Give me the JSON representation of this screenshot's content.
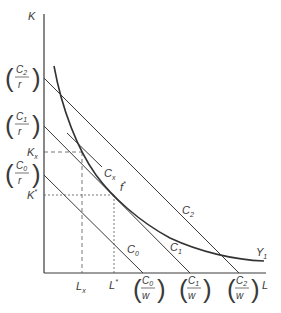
{
  "diagram": {
    "type": "isoquant-isocost",
    "axes": {
      "y_label": "K",
      "x_label": "L"
    },
    "y_intercepts": [
      {
        "num": "C",
        "num_sub": "2",
        "den": "r"
      },
      {
        "num": "C",
        "num_sub": "1",
        "den": "r"
      },
      {
        "num": "C",
        "num_sub": "0",
        "den": "r"
      }
    ],
    "x_intercepts": [
      {
        "num": "C",
        "num_sub": "0",
        "den": "w"
      },
      {
        "num": "C",
        "num_sub": "1",
        "den": "w"
      },
      {
        "num": "C",
        "num_sub": "2",
        "den": "w"
      }
    ],
    "y_ticks": [
      {
        "base": "K",
        "sub": "x"
      },
      {
        "base": "K",
        "sup": "*"
      }
    ],
    "x_ticks": [
      {
        "base": "L",
        "sub": "x"
      },
      {
        "base": "L",
        "sup": "*"
      }
    ],
    "lines": [
      {
        "base": "C",
        "sub": "2"
      },
      {
        "base": "C",
        "sub": "1"
      },
      {
        "base": "C",
        "sub": "0"
      },
      {
        "base": "C",
        "sub": "x"
      }
    ],
    "curve": {
      "base": "Y",
      "sub": "1"
    },
    "point": {
      "base": "f",
      "sup": "*"
    },
    "colors": {
      "line": "#3a3a3a",
      "background": "#ffffff"
    }
  }
}
